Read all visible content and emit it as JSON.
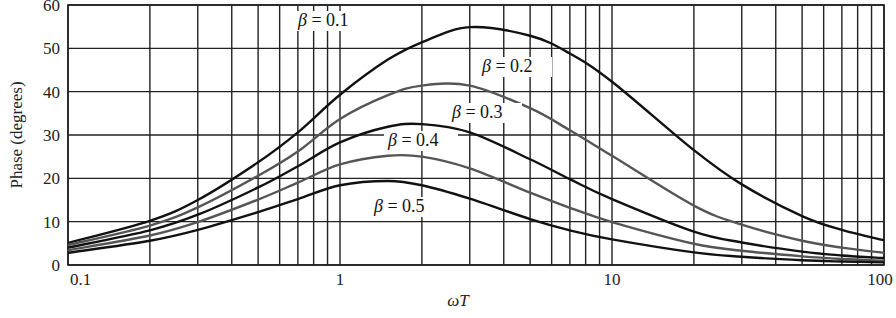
{
  "chart_data": {
    "type": "line",
    "title": "",
    "xlabel": "ωT",
    "ylabel": "Phase (degrees)",
    "xscale": "log",
    "xlim": [
      0.1,
      100
    ],
    "ylim": [
      0,
      60
    ],
    "grid": true,
    "x_ticks": [
      {
        "value": 0.1,
        "label": "0.1"
      },
      {
        "value": 1,
        "label": "1"
      },
      {
        "value": 10,
        "label": "10"
      },
      {
        "value": 100,
        "label": "100"
      }
    ],
    "y_ticks": [
      {
        "value": 0,
        "label": "0"
      },
      {
        "value": 10,
        "label": "10"
      },
      {
        "value": 20,
        "label": "20"
      },
      {
        "value": 30,
        "label": "30"
      },
      {
        "value": 40,
        "label": "40"
      },
      {
        "value": 50,
        "label": "50"
      },
      {
        "value": 60,
        "label": "60"
      }
    ],
    "x": [
      0.1,
      0.2,
      0.3,
      0.5,
      0.7,
      1,
      1.5,
      2,
      3,
      5,
      7,
      10,
      20,
      30,
      50,
      70,
      100
    ],
    "series": [
      {
        "name": "β = 0.1",
        "color": "#111111",
        "label_at": [
          298,
          26
        ],
        "values": [
          5.1,
          10.2,
          15.0,
          23.7,
          30.6,
          39.3,
          47.4,
          51.4,
          54.9,
          52.9,
          48.8,
          42.3,
          26.5,
          18.6,
          11.3,
          8.1,
          5.7
        ]
      },
      {
        "name": "β = 0.2",
        "color": "#555555",
        "label_at": [
          482,
          72
        ],
        "values": [
          4.6,
          9.1,
          13.3,
          20.6,
          26.2,
          33.7,
          39.2,
          41.4,
          41.4,
          36.2,
          31.1,
          25.2,
          13.7,
          9.3,
          5.6,
          4.0,
          2.8
        ]
      },
      {
        "name": "β = 0.3",
        "color": "#111111",
        "label_at": [
          452,
          118
        ],
        "values": [
          4.0,
          8.0,
          11.6,
          17.9,
          22.8,
          28.3,
          31.9,
          32.5,
          30.6,
          24.4,
          19.8,
          15.2,
          7.7,
          5.2,
          3.1,
          2.2,
          1.6
        ]
      },
      {
        "name": "β = 0.4",
        "color": "#555555",
        "label_at": [
          388,
          146
        ],
        "values": [
          3.4,
          6.8,
          9.9,
          15.1,
          19.0,
          23.2,
          25.2,
          25.0,
          22.3,
          16.7,
          13.2,
          9.9,
          4.9,
          3.3,
          2.0,
          1.4,
          1.0
        ]
      },
      {
        "name": "β = 0.5",
        "color": "#111111",
        "label_at": [
          374,
          212
        ],
        "values": [
          2.8,
          5.6,
          8.1,
          12.2,
          15.2,
          18.4,
          19.4,
          18.4,
          15.3,
          10.6,
          8.0,
          5.9,
          2.9,
          1.9,
          1.1,
          0.8,
          0.6
        ]
      }
    ]
  }
}
